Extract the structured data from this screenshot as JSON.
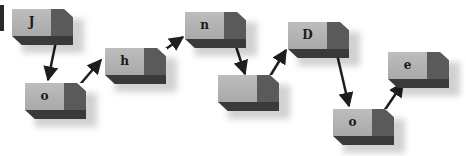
{
  "diagram": {
    "type": "linked-blocks",
    "nodes": [
      {
        "id": "n1",
        "label": "J",
        "x": 12,
        "y": 9
      },
      {
        "id": "n2",
        "label": "o",
        "x": 25,
        "y": 83
      },
      {
        "id": "n3",
        "label": "h",
        "x": 105,
        "y": 48
      },
      {
        "id": "n4",
        "label": "n",
        "x": 185,
        "y": 12
      },
      {
        "id": "n5",
        "label": "",
        "x": 218,
        "y": 75
      },
      {
        "id": "n6",
        "label": "D",
        "x": 288,
        "y": 22
      },
      {
        "id": "n7",
        "label": "o",
        "x": 333,
        "y": 109
      },
      {
        "id": "n8",
        "label": "e",
        "x": 388,
        "y": 52
      }
    ],
    "edges": [
      {
        "from": "n1",
        "to": "n2"
      },
      {
        "from": "n2",
        "to": "n3"
      },
      {
        "from": "n3",
        "to": "n4"
      },
      {
        "from": "n4",
        "to": "n5"
      },
      {
        "from": "n5",
        "to": "n6"
      },
      {
        "from": "n6",
        "to": "n7"
      },
      {
        "from": "n7",
        "to": "n8"
      }
    ],
    "colors": {
      "front": "#b3b3b3",
      "side": "#5a5a5a",
      "bottom": "#3a3a3a",
      "arrow": "#1e1e1e"
    }
  }
}
